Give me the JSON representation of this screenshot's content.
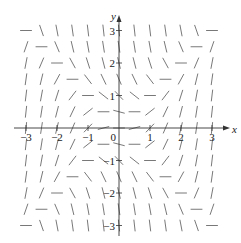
{
  "chart_data": {
    "type": "slope_field",
    "title": "",
    "equation": "dy/dx = x^2 - y^2",
    "xlabel": "x",
    "ylabel": "y",
    "xlim": [
      -3,
      3
    ],
    "ylim": [
      -3,
      3
    ],
    "grid": false,
    "sample_step": 0.5,
    "x_ticks": [
      -3,
      -2,
      -1,
      0,
      1,
      2,
      3
    ],
    "y_ticks": [
      -3,
      -2,
      -1,
      1,
      2,
      3
    ],
    "x_tick_labels": [
      "−3",
      "−2",
      "−1",
      "0",
      "1",
      "2",
      "3"
    ],
    "y_tick_labels": [
      "−3",
      "−2",
      "−1",
      "1",
      "2",
      "3"
    ]
  },
  "colors": {
    "axis": "#333333",
    "segment": "#555555",
    "background": "#ffffff"
  }
}
